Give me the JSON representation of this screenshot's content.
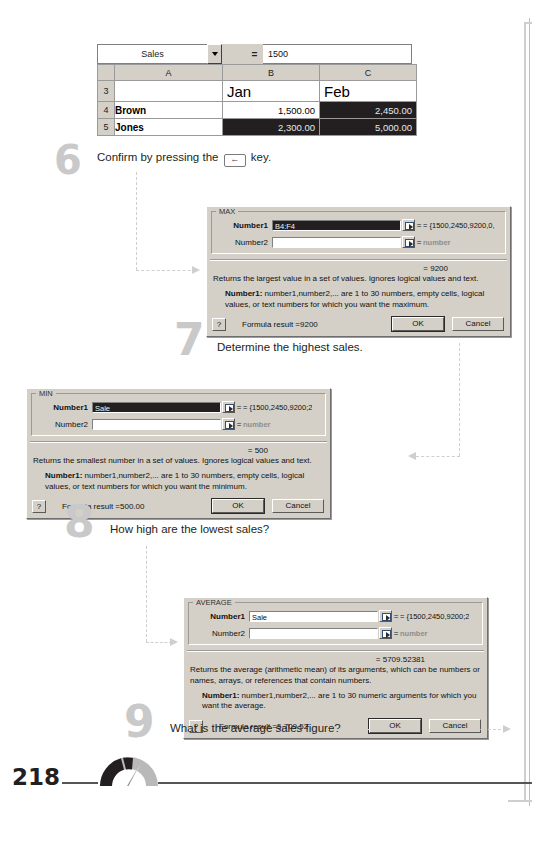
{
  "page": {
    "number": "218",
    "logo_icon": "gauge-icon"
  },
  "spreadsheet": {
    "name_box_value": "Sales",
    "name_box_icon": "chevron-down-icon",
    "equals_button": "=",
    "formula_bar_value": "1500",
    "column_headers": [
      "",
      "A",
      "B",
      "C"
    ],
    "rows": [
      {
        "header": "3",
        "cells": [
          {
            "text": "",
            "style": "plain"
          },
          {
            "text": "Jan",
            "style": "big"
          },
          {
            "text": "Feb",
            "style": "big"
          }
        ]
      },
      {
        "header": "4",
        "cells": [
          {
            "text": "Brown",
            "style": "bold"
          },
          {
            "text": "1,500.00",
            "style": "num"
          },
          {
            "text": "2,450.00",
            "style": "num-sel"
          }
        ]
      },
      {
        "header": "5",
        "cells": [
          {
            "text": "Jones",
            "style": "bold"
          },
          {
            "text": "2,300.00",
            "style": "num-sel"
          },
          {
            "text": "5,000.00",
            "style": "num-sel"
          }
        ]
      }
    ]
  },
  "steps": [
    {
      "number": "6",
      "text_before": "Confirm by pressing the",
      "key_icon": "enter-key-icon",
      "key_label": "←",
      "text_after": "key."
    },
    {
      "number": "7",
      "text": "Determine the highest sales."
    },
    {
      "number": "8",
      "text": "How high are the lowest sales?"
    },
    {
      "number": "9",
      "text": "What is the average sales figure?"
    }
  ],
  "dialogs": {
    "max": {
      "title": "MAX",
      "number1_label": "Number1",
      "number1_value": "B4:F4",
      "number2_label": "Number2",
      "number2_value": "",
      "number1_result": "= {1500,2450,9200,0,",
      "number2_result": "number",
      "result_line": "= 9200",
      "description": "Returns the largest value in a set of values. Ignores logical values and text.",
      "arg_name": "Number1:",
      "arg_description": "number1,number2,... are 1 to 30 numbers, empty cells, logical values, or text numbers for which you want the maximum.",
      "help_label": "?",
      "formula_result": "Formula result =9200",
      "ok_label": "OK",
      "cancel_label": "Cancel"
    },
    "min": {
      "title": "MIN",
      "number1_label": "Number1",
      "number1_value": "Sale",
      "number2_label": "Number2",
      "number2_value": "",
      "number1_result": "= {1500,2450,9200;2",
      "number2_result": "number",
      "result_line": "= 500",
      "description": "Returns the smallest number in a set of values. Ignores logical values and text.",
      "arg_name": "Number1:",
      "arg_description": "number1,number2,... are 1 to 30 numbers, empty cells, logical values, or text numbers for which you want the minimum.",
      "help_label": "?",
      "formula_result": "Formula result =500.00",
      "ok_label": "OK",
      "cancel_label": "Cancel"
    },
    "average": {
      "title": "AVERAGE",
      "number1_label": "Number1",
      "number1_value": "Sale",
      "number2_label": "Number2",
      "number2_value": "",
      "number1_result": "= {1500,2450,9200;2",
      "number2_result": "number",
      "result_line": "= 5709.52381",
      "description": "Returns the average (arithmetic mean) of its arguments, which can be numbers or names, arrays, or references that contain numbers.",
      "arg_name": "Number1:",
      "arg_description": "number1,number2,... are 1 to 30 numeric arguments for which you want the average.",
      "help_label": "?",
      "formula_result": "Formula result =5,709.52",
      "ok_label": "OK",
      "cancel_label": "Cancel"
    }
  }
}
